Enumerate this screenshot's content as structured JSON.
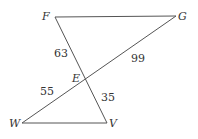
{
  "diagram": {
    "points": {
      "F": {
        "label": "F",
        "x": 55,
        "y": 17
      },
      "G": {
        "label": "G",
        "x": 176,
        "y": 16
      },
      "E": {
        "label": "E",
        "x": 86,
        "y": 79
      },
      "W": {
        "label": "W",
        "x": 22,
        "y": 123
      },
      "V": {
        "label": "V",
        "x": 107,
        "y": 123
      }
    },
    "segments": [
      "FG",
      "FV",
      "GW",
      "WV"
    ],
    "lengths": {
      "FE": "63",
      "EG": "99",
      "WE": "55",
      "EV": "35"
    },
    "line_color": "#555555"
  }
}
